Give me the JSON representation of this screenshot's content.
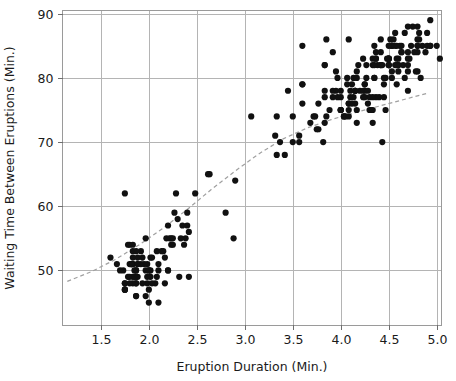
{
  "chart_data": {
    "type": "scatter",
    "title": "",
    "xlabel": "Eruption Duration (Min.)",
    "ylabel": "Waiting Time Between Eruptions (Min.)",
    "xlim": [
      1.1,
      5.05
    ],
    "ylim": [
      41.5,
      90.5
    ],
    "xticks": [
      1.5,
      2.0,
      2.5,
      3.0,
      3.5,
      4.0,
      4.5,
      5.0
    ],
    "xtick_labels": [
      "1.5",
      "2.0",
      "2.5",
      "3.0",
      "3.5",
      "4.0",
      "4.5",
      "5.0"
    ],
    "yticks": [
      50,
      60,
      70,
      80,
      90
    ],
    "ytick_labels": [
      "50",
      "60",
      "70",
      "80",
      "90"
    ],
    "grid": true,
    "grid_color": "#b4b4b4",
    "legend": null,
    "marker": "circle",
    "marker_color": "#111111",
    "marker_size": 3.1,
    "point_count": 272,
    "series": [
      {
        "name": "Old Faithful eruptions",
        "x": [
          3.6,
          1.8,
          3.333,
          2.283,
          4.533,
          2.883,
          4.7,
          3.6,
          1.95,
          4.35,
          1.833,
          3.917,
          4.2,
          1.75,
          4.7,
          2.167,
          1.75,
          4.8,
          1.6,
          4.25,
          1.8,
          1.75,
          3.45,
          3.067,
          4.533,
          3.6,
          1.967,
          4.083,
          3.85,
          4.433,
          4.3,
          4.467,
          3.367,
          4.033,
          3.833,
          2.017,
          1.867,
          4.833,
          1.833,
          4.783,
          4.35,
          1.883,
          4.567,
          1.75,
          4.533,
          3.317,
          3.833,
          2.1,
          4.633,
          2.0,
          4.8,
          4.716,
          1.833,
          4.833,
          1.733,
          4.883,
          3.717,
          1.667,
          4.567,
          4.317,
          2.233,
          4.5,
          1.75,
          4.8,
          1.817,
          4.4,
          4.167,
          4.7,
          2.067,
          4.7,
          4.033,
          1.967,
          4.5,
          4.0,
          1.983,
          5.067,
          2.017,
          4.567,
          3.883,
          3.6,
          4.133,
          4.333,
          4.1,
          2.633,
          4.067,
          4.933,
          3.95,
          4.517,
          2.167,
          4.0,
          2.2,
          4.333,
          1.867,
          4.817,
          1.833,
          4.3,
          4.667,
          3.75,
          1.867,
          4.9,
          2.483,
          4.367,
          2.1,
          4.5,
          4.05,
          1.867,
          4.7,
          1.783,
          4.85,
          3.683,
          4.733,
          2.3,
          4.9,
          4.417,
          1.7,
          4.633,
          2.317,
          4.6,
          1.817,
          4.417,
          2.617,
          4.067,
          4.25,
          1.967,
          4.6,
          3.767,
          1.917,
          4.5,
          2.267,
          4.65,
          1.867,
          4.167,
          2.8,
          4.333,
          1.833,
          4.383,
          1.883,
          4.933,
          2.033,
          3.733,
          4.233,
          2.233,
          4.533,
          4.817,
          4.333,
          1.983,
          4.633,
          2.017,
          5.1,
          1.8,
          5.033,
          4.0,
          2.4,
          4.6,
          3.567,
          4.0,
          4.5,
          4.083,
          1.8,
          3.967,
          2.2,
          4.15,
          2.0,
          3.833,
          3.5,
          4.583,
          2.367,
          5.0,
          1.933,
          4.617,
          1.917,
          2.083,
          4.583,
          3.333,
          4.167,
          4.333,
          4.5,
          2.417,
          4.0,
          4.167,
          1.883,
          4.583,
          4.25,
          3.767,
          2.033,
          4.433,
          4.083,
          1.833,
          4.417,
          2.183,
          4.8,
          1.833,
          4.8,
          4.1,
          3.966,
          4.233,
          3.5,
          4.366,
          2.25,
          4.667,
          2.1,
          4.35,
          4.133,
          1.867,
          4.6,
          1.783,
          4.367,
          3.85,
          1.933,
          4.5,
          2.383,
          4.7,
          1.867,
          3.833,
          3.417,
          4.233,
          2.4,
          4.8,
          2.0,
          4.15,
          1.867,
          4.267,
          1.75,
          4.483,
          4.0,
          4.117,
          4.083,
          4.267,
          3.917,
          4.55,
          4.083,
          2.417,
          4.183,
          2.217,
          4.45,
          1.883,
          1.85,
          4.283,
          3.95,
          2.333,
          4.15,
          2.35,
          4.933,
          2.9,
          4.583,
          3.833,
          2.083,
          4.367,
          2.133,
          4.35,
          2.2,
          4.45,
          3.567,
          4.5,
          4.15,
          3.817,
          3.917,
          4.45,
          2.0,
          4.283,
          4.767,
          4.533,
          1.85,
          4.25,
          1.983,
          2.25,
          4.75,
          4.117,
          2.15,
          4.417,
          1.817,
          4.467
        ],
        "y": [
          79,
          54,
          74,
          62,
          85,
          55,
          88,
          85,
          51,
          85,
          54,
          84,
          78,
          47,
          83,
          52,
          62,
          84,
          52,
          79,
          51,
          47,
          78,
          74,
          85,
          79,
          55,
          86,
          86,
          70,
          75,
          75,
          70,
          74,
          77,
          49,
          48,
          91,
          51,
          81,
          80,
          52,
          85,
          47,
          85,
          71,
          82,
          45,
          84,
          47,
          88,
          83,
          49,
          80,
          50,
          84,
          74,
          51,
          87,
          75,
          55,
          83,
          48,
          85,
          51,
          77,
          75,
          78,
          48,
          81,
          74,
          50,
          85,
          75,
          48,
          83,
          50,
          82,
          75,
          76,
          80,
          82,
          78,
          65,
          80,
          89,
          78,
          86,
          48,
          75,
          50,
          73,
          48,
          87,
          51,
          77,
          87,
          72,
          50,
          87,
          62,
          77,
          51,
          83,
          74,
          50,
          84,
          49,
          85,
          73,
          85,
          58,
          85,
          82,
          50,
          84,
          49,
          82,
          51,
          84,
          65,
          79,
          78,
          46,
          81,
          76,
          53,
          82,
          59,
          82,
          46,
          81,
          59,
          83,
          48,
          82,
          51,
          85,
          52,
          74,
          83,
          54,
          81,
          86,
          75,
          51,
          85,
          52,
          90,
          48,
          83,
          75,
          59,
          82,
          70,
          77,
          82,
          76,
          49,
          77,
          50,
          78,
          45,
          73,
          70,
          82,
          54,
          85,
          48,
          85,
          51,
          49,
          85,
          68,
          80,
          77,
          82,
          49,
          78,
          73,
          49,
          79,
          77,
          72,
          48,
          82,
          76,
          52,
          86,
          55,
          85,
          53,
          81,
          77,
          80,
          78,
          74,
          83,
          54,
          80,
          50,
          80,
          77,
          53,
          83,
          54,
          84,
          74,
          52,
          83,
          55,
          82,
          46,
          82,
          68,
          77,
          57,
          86,
          50,
          78,
          49,
          82,
          48,
          83,
          75,
          79,
          75,
          80,
          77,
          86,
          74,
          56,
          82,
          55,
          80,
          51,
          50,
          78,
          81,
          55,
          78,
          57,
          85,
          64,
          83,
          78,
          53,
          83,
          53,
          82,
          57,
          77,
          71,
          83,
          76,
          70,
          78,
          79,
          50,
          76,
          84,
          80,
          49,
          79,
          49,
          55,
          88,
          76,
          53,
          82,
          51,
          80
        ]
      }
    ],
    "trendline": {
      "label": "lowess-trend",
      "style": "dashed",
      "color": "#a0a0a0",
      "points": [
        [
          1.15,
          48.3
        ],
        [
          1.4,
          49.8
        ],
        [
          1.65,
          51.7
        ],
        [
          1.9,
          54.0
        ],
        [
          2.15,
          56.6
        ],
        [
          2.4,
          59.5
        ],
        [
          2.65,
          62.6
        ],
        [
          2.9,
          65.5
        ],
        [
          3.15,
          68.2
        ],
        [
          3.4,
          70.5
        ],
        [
          3.65,
          72.2
        ],
        [
          3.9,
          73.5
        ],
        [
          4.15,
          74.6
        ],
        [
          4.4,
          75.6
        ],
        [
          4.65,
          76.6
        ],
        [
          4.9,
          77.6
        ]
      ]
    }
  }
}
